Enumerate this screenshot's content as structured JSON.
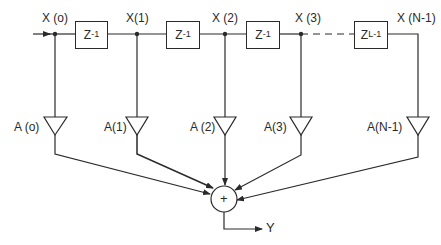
{
  "diagram": {
    "type": "FIR filter (tapped delay line) block diagram",
    "input_label": "",
    "taps": [
      {
        "id": "x0",
        "signal": "X (o)",
        "coef": "A (o)"
      },
      {
        "id": "x1",
        "signal": "X(1)",
        "coef": "A(1)"
      },
      {
        "id": "x2",
        "signal": "X (2)",
        "coef": "A (2)"
      },
      {
        "id": "x3",
        "signal": "X (3)",
        "coef": "A(3)"
      },
      {
        "id": "xn1",
        "signal": "X (N-1)",
        "coef": "A(N-1)"
      }
    ],
    "delays": [
      {
        "base": "Z",
        "exp": "-1"
      },
      {
        "base": "Z",
        "exp": "-1"
      },
      {
        "base": "Z",
        "exp": "-1"
      },
      {
        "base": "Z",
        "exp": "L-1"
      }
    ],
    "summer_symbol": "+",
    "output_label": "Y",
    "line_color": "#2a2a2a"
  }
}
